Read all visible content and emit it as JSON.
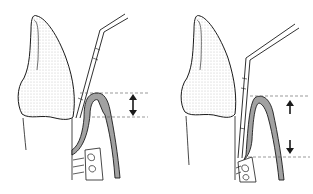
{
  "figure": {
    "type": "dental-diagram",
    "panels": [
      {
        "id": "left",
        "description": "periodontal probe in shallow gingival sulcus",
        "arrow": "double-headed"
      },
      {
        "id": "right",
        "description": "periodontal probe in deep periodontal pocket",
        "arrow": "up-and-down"
      }
    ]
  },
  "colors": {
    "line": "#1a1a1a",
    "gum_fill": "#9a9a9a",
    "crown_fill": "#d8d8d8",
    "dash": "#555555",
    "background": "#ffffff"
  }
}
